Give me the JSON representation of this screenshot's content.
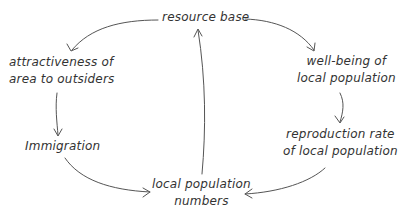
{
  "diagram": {
    "type": "causal-loop",
    "nodes": {
      "resource_base": {
        "line1": "resource base"
      },
      "wellbeing": {
        "line1": "well-being of",
        "line2": "local population"
      },
      "reproduction": {
        "line1": "reproduction rate",
        "line2": "of local population"
      },
      "population_numbers": {
        "line1": "local population",
        "line2": "numbers"
      },
      "immigration": {
        "line1": "Immigration"
      },
      "attractiveness": {
        "line1": "attractiveness of",
        "line2": "area to outsiders"
      }
    },
    "edges": [
      {
        "from": "resource base",
        "to": "well-being of local population"
      },
      {
        "from": "well-being of local population",
        "to": "reproduction rate of local population"
      },
      {
        "from": "reproduction rate of local population",
        "to": "local population numbers"
      },
      {
        "from": "local population numbers",
        "to": "resource base"
      },
      {
        "from": "resource base",
        "to": "attractiveness of area to outsiders"
      },
      {
        "from": "attractiveness of area to outsiders",
        "to": "Immigration"
      },
      {
        "from": "Immigration",
        "to": "local population numbers"
      }
    ],
    "colors": {
      "text": "#333333",
      "arrow": "#555555",
      "background": "#ffffff"
    }
  }
}
